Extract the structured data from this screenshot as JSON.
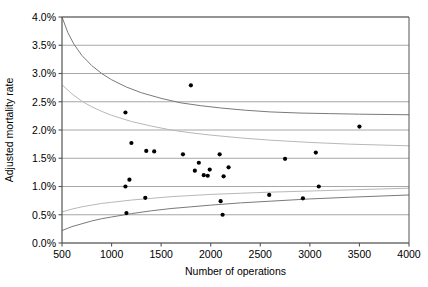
{
  "chart_data": {
    "type": "scatter",
    "title": "",
    "xlabel": "Number of operations",
    "ylabel": "Adjusted mortality rate",
    "xlim": [
      500,
      4000
    ],
    "ylim": [
      0,
      4
    ],
    "xticks": [
      500,
      1000,
      1500,
      2000,
      2500,
      3000,
      3500,
      4000
    ],
    "xtick_labels": [
      "500",
      "1000",
      "1500",
      "2000",
      "2500",
      "3000",
      "3500",
      "4000"
    ],
    "yticks": [
      0,
      0.5,
      1.0,
      1.5,
      2.0,
      2.5,
      3.0,
      3.5,
      4.0
    ],
    "ytick_labels": [
      "0.0%",
      "0.5%",
      "1.0%",
      "1.5%",
      "2.0%",
      "2.5%",
      "3.0%",
      "3.5%",
      "4.0%"
    ],
    "grid": "horizontal",
    "legend": "none",
    "y_unit": "percent",
    "points": [
      {
        "x": 1140,
        "y": 2.31
      },
      {
        "x": 1800,
        "y": 2.79
      },
      {
        "x": 3500,
        "y": 2.06
      },
      {
        "x": 1200,
        "y": 1.77
      },
      {
        "x": 1350,
        "y": 1.63
      },
      {
        "x": 1430,
        "y": 1.62
      },
      {
        "x": 1720,
        "y": 1.57
      },
      {
        "x": 2090,
        "y": 1.57
      },
      {
        "x": 3060,
        "y": 1.6
      },
      {
        "x": 2750,
        "y": 1.49
      },
      {
        "x": 1880,
        "y": 1.42
      },
      {
        "x": 1840,
        "y": 1.28
      },
      {
        "x": 1990,
        "y": 1.3
      },
      {
        "x": 2180,
        "y": 1.34
      },
      {
        "x": 1930,
        "y": 1.2
      },
      {
        "x": 1970,
        "y": 1.19
      },
      {
        "x": 2130,
        "y": 1.18
      },
      {
        "x": 1180,
        "y": 1.12
      },
      {
        "x": 1140,
        "y": 1.0
      },
      {
        "x": 3090,
        "y": 1.0
      },
      {
        "x": 1340,
        "y": 0.8
      },
      {
        "x": 2100,
        "y": 0.74
      },
      {
        "x": 2590,
        "y": 0.85
      },
      {
        "x": 2930,
        "y": 0.79
      },
      {
        "x": 1150,
        "y": 0.53
      },
      {
        "x": 2120,
        "y": 0.5
      }
    ],
    "curves": [
      {
        "name": "upper-99.8-limit",
        "color": "#7a7a7a",
        "start": {
          "x": 500,
          "y": 4.0
        },
        "end": {
          "x": 4000,
          "y": 2.3
        },
        "points": [
          [
            500,
            4.0
          ],
          [
            560,
            3.72
          ],
          [
            620,
            3.52
          ],
          [
            700,
            3.32
          ],
          [
            800,
            3.14
          ],
          [
            900,
            3.0
          ],
          [
            1000,
            2.89
          ],
          [
            1150,
            2.76
          ],
          [
            1300,
            2.66
          ],
          [
            1500,
            2.56
          ],
          [
            1700,
            2.48
          ],
          [
            1900,
            2.43
          ],
          [
            2100,
            2.39
          ],
          [
            2350,
            2.35
          ],
          [
            2600,
            2.32
          ],
          [
            2900,
            2.3
          ],
          [
            3200,
            2.29
          ],
          [
            3500,
            2.28
          ],
          [
            4000,
            2.27
          ]
        ]
      },
      {
        "name": "upper-95-limit",
        "color": "#b8b8b8",
        "start": {
          "x": 500,
          "y": 2.8
        },
        "end": {
          "x": 4000,
          "y": 1.72
        },
        "points": [
          [
            500,
            2.8
          ],
          [
            600,
            2.64
          ],
          [
            700,
            2.51
          ],
          [
            800,
            2.41
          ],
          [
            900,
            2.33
          ],
          [
            1000,
            2.26
          ],
          [
            1200,
            2.15
          ],
          [
            1400,
            2.07
          ],
          [
            1600,
            2.0
          ],
          [
            1800,
            1.95
          ],
          [
            2000,
            1.91
          ],
          [
            2300,
            1.86
          ],
          [
            2600,
            1.82
          ],
          [
            3000,
            1.78
          ],
          [
            3400,
            1.75
          ],
          [
            4000,
            1.72
          ]
        ]
      },
      {
        "name": "lower-95-limit",
        "color": "#b8b8b8",
        "start": {
          "x": 500,
          "y": 0.55
        },
        "end": {
          "x": 4000,
          "y": 0.97
        },
        "points": [
          [
            500,
            0.55
          ],
          [
            600,
            0.6
          ],
          [
            700,
            0.64
          ],
          [
            800,
            0.67
          ],
          [
            900,
            0.7
          ],
          [
            1000,
            0.72
          ],
          [
            1200,
            0.76
          ],
          [
            1400,
            0.79
          ],
          [
            1600,
            0.82
          ],
          [
            1800,
            0.84
          ],
          [
            2000,
            0.86
          ],
          [
            2300,
            0.88
          ],
          [
            2600,
            0.9
          ],
          [
            3000,
            0.92
          ],
          [
            3400,
            0.94
          ],
          [
            4000,
            0.97
          ]
        ]
      },
      {
        "name": "lower-99.8-limit",
        "color": "#7a7a7a",
        "start": {
          "x": 500,
          "y": 0.22
        },
        "end": {
          "x": 4000,
          "y": 0.85
        },
        "points": [
          [
            500,
            0.22
          ],
          [
            600,
            0.29
          ],
          [
            700,
            0.34
          ],
          [
            800,
            0.39
          ],
          [
            900,
            0.43
          ],
          [
            1000,
            0.46
          ],
          [
            1200,
            0.52
          ],
          [
            1400,
            0.57
          ],
          [
            1600,
            0.61
          ],
          [
            1800,
            0.64
          ],
          [
            2000,
            0.67
          ],
          [
            2300,
            0.71
          ],
          [
            2600,
            0.74
          ],
          [
            3000,
            0.78
          ],
          [
            3400,
            0.81
          ],
          [
            4000,
            0.85
          ]
        ]
      }
    ]
  },
  "figure": {
    "background": "#ffffff",
    "grid_color": "#9d9d9d",
    "frame_color": "#555555",
    "marker_color": "#000000"
  }
}
